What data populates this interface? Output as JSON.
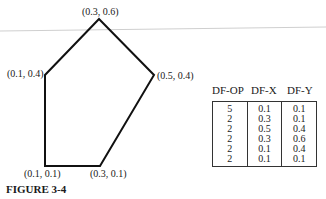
{
  "figure": {
    "caption": "FIGURE 3-4",
    "vertices": [
      {
        "label": "(0.3, 0.6)",
        "x": 0.3,
        "y": 0.6
      },
      {
        "label": "(0.1, 0.4)",
        "x": 0.1,
        "y": 0.4
      },
      {
        "label": "(0.5, 0.4)",
        "x": 0.5,
        "y": 0.4
      },
      {
        "label": "(0.1, 0.1)",
        "x": 0.1,
        "y": 0.1
      },
      {
        "label": "(0.3, 0.1)",
        "x": 0.3,
        "y": 0.1
      }
    ]
  },
  "table": {
    "headers": [
      "DF-OP",
      "DF-X",
      "DF-Y"
    ],
    "rows": [
      [
        "5",
        "0.1",
        "0.1"
      ],
      [
        "2",
        "0.3",
        "0.1"
      ],
      [
        "2",
        "0.5",
        "0.4"
      ],
      [
        "2",
        "0.3",
        "0.6"
      ],
      [
        "2",
        "0.1",
        "0.4"
      ],
      [
        "2",
        "0.1",
        "0.1"
      ]
    ]
  }
}
